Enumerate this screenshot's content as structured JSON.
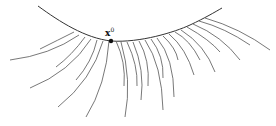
{
  "diagram": {
    "point_label": "x",
    "point_superscript": "0",
    "point": {
      "x": 111,
      "y": 41
    },
    "main_curve": "M38,6 C60,22 85,38 111,41 C140,43 175,32 190,25 C205,18 215,12 222,8",
    "trajectories": [
      "M74,32 Q58,40 40,49",
      "M79,35 Q50,55 10,60",
      "M85,37 Q72,55 56,67",
      "M91,39 Q70,72 30,88",
      "M97,40 Q92,62 76,80",
      "M103,41 Q92,80 58,107",
      "M109,41 Q106,85 86,117",
      "M116,41 Q126,62 124,86",
      "M121,42 Q132,80 125,117",
      "M127,42 Q138,65 137,86",
      "M133,42 Q145,70 141,100",
      "M139,41 Q150,60 148,86",
      "M145,40 Q162,65 163,110",
      "M151,39 Q164,56 163,78",
      "M157,38 Q174,58 174,97",
      "M163,36 Q176,48 178,60",
      "M169,34 Q186,48 194,75",
      "M175,32 Q190,40 200,60",
      "M181,30 Q205,45 215,72",
      "M187,27 Q210,40 220,52",
      "M193,24 Q222,36 240,60",
      "M199,21 Q225,28 250,45",
      "M205,18 Q240,28 270,50"
    ]
  },
  "colors": {
    "stroke": "#555555",
    "main": "#333333",
    "point": "#111111"
  }
}
